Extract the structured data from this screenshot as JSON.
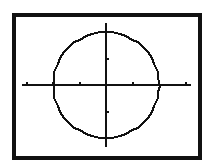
{
  "figure": {
    "frame": {
      "x": 12,
      "y": 13,
      "w": 190,
      "h": 147,
      "thickness": 4,
      "color": "#111111"
    },
    "background": "#ffffff",
    "ink": "#111111"
  },
  "graph": {
    "origin_px": {
      "x": 106,
      "y": 85
    },
    "tick_spacing_px": 26.5,
    "x_axis": {
      "x_start_px": 22,
      "x_end_px": 191,
      "ticks": [
        -3,
        -2,
        -1,
        1,
        2,
        3
      ]
    },
    "y_axis": {
      "y_start_px": 23,
      "y_end_px": 147,
      "ticks": [
        -2,
        -1,
        1,
        2
      ]
    },
    "circle": {
      "center": [
        0,
        0
      ],
      "radius": 2,
      "equation": "x^2 + y^2 = 4"
    }
  }
}
